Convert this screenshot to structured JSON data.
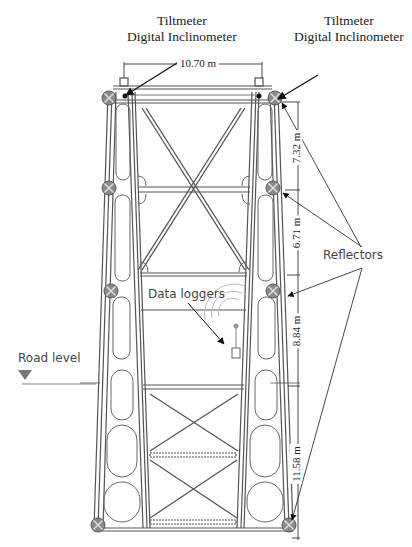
{
  "diagram": {
    "labels": {
      "tiltmeter_left": {
        "line1": "Tiltmeter",
        "line2": "Digital Inclinometer"
      },
      "tiltmeter_right": {
        "line1": "Tiltmeter",
        "line2": "Digital Inclinometer"
      },
      "reflectors": "Reflectors",
      "data_loggers": "Data loggers",
      "road_level": "Road level"
    },
    "dimensions": {
      "top_width": "10.70 m",
      "segments": [
        "7.32 m",
        "6.71 m",
        "8.84 m",
        "11.58 m"
      ]
    },
    "colors": {
      "line": "#555555",
      "reflector_fill": "#8a8a8a",
      "text": "#222222",
      "signal_arcs": "#bbbbbb"
    },
    "sensors": {
      "tiltmeters": 2,
      "reflectors_per_side": 4,
      "data_loggers": 1
    }
  }
}
